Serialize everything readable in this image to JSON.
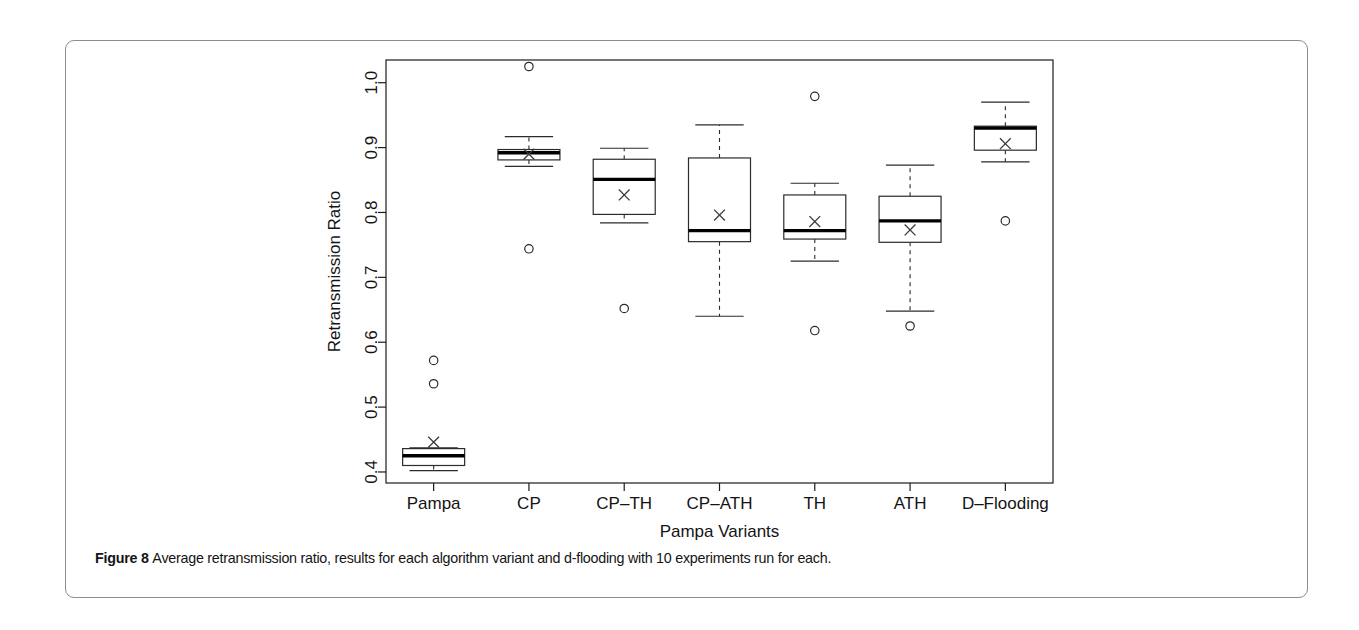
{
  "figure": {
    "caption_label": "Figure 8",
    "caption_text": "Average retransmission ratio, results for each algorithm variant and d-flooding with 10 experiments run for each."
  },
  "chart_data": {
    "type": "box",
    "title": "",
    "xlabel": "Pampa Variants",
    "ylabel": "Retransmission Ratio",
    "categories": [
      "Pampa",
      "CP",
      "CP–TH",
      "CP–ATH",
      "TH",
      "ATH",
      "D–Flooding"
    ],
    "ytick_labels": [
      "0.4",
      "0.5",
      "0.6",
      "0.7",
      "0.8",
      "0.9",
      "1.0"
    ],
    "ytick_values": [
      0.4,
      0.5,
      0.6,
      0.7,
      0.8,
      0.9,
      1.0
    ],
    "ylim": [
      0.383,
      1.035
    ],
    "grid": false,
    "legend": "none",
    "mean_marker": "x",
    "outlier_marker": "circle",
    "series": [
      {
        "name": "Pampa",
        "whisker_low": 0.402,
        "q1": 0.41,
        "median": 0.425,
        "q3": 0.436,
        "whisker_high": 0.437,
        "mean": 0.446,
        "outliers": [
          0.572,
          0.536
        ]
      },
      {
        "name": "CP",
        "whisker_low": 0.871,
        "q1": 0.881,
        "median": 0.892,
        "q3": 0.897,
        "whisker_high": 0.917,
        "mean": 0.89,
        "outliers": [
          1.025,
          0.744
        ]
      },
      {
        "name": "CP–TH",
        "whisker_low": 0.784,
        "q1": 0.797,
        "median": 0.851,
        "q3": 0.882,
        "whisker_high": 0.899,
        "mean": 0.827,
        "outliers": [
          0.652
        ]
      },
      {
        "name": "CP–ATH",
        "whisker_low": 0.64,
        "q1": 0.755,
        "median": 0.772,
        "q3": 0.884,
        "whisker_high": 0.935,
        "mean": 0.796,
        "outliers": []
      },
      {
        "name": "TH",
        "whisker_low": 0.725,
        "q1": 0.759,
        "median": 0.772,
        "q3": 0.827,
        "whisker_high": 0.845,
        "mean": 0.786,
        "outliers": [
          0.979,
          0.618
        ]
      },
      {
        "name": "ATH",
        "whisker_low": 0.648,
        "q1": 0.754,
        "median": 0.787,
        "q3": 0.825,
        "whisker_high": 0.873,
        "mean": 0.773,
        "outliers": [
          0.625
        ]
      },
      {
        "name": "D–Flooding",
        "whisker_low": 0.878,
        "q1": 0.896,
        "median": 0.93,
        "q3": 0.933,
        "whisker_high": 0.97,
        "mean": 0.906,
        "outliers": [
          0.787
        ]
      }
    ]
  },
  "colors": {
    "axis": "#1b1b1b",
    "box_stroke": "#2b2b2b",
    "median": "#000000",
    "frame": "#8d8d8d",
    "text": "#141414"
  }
}
